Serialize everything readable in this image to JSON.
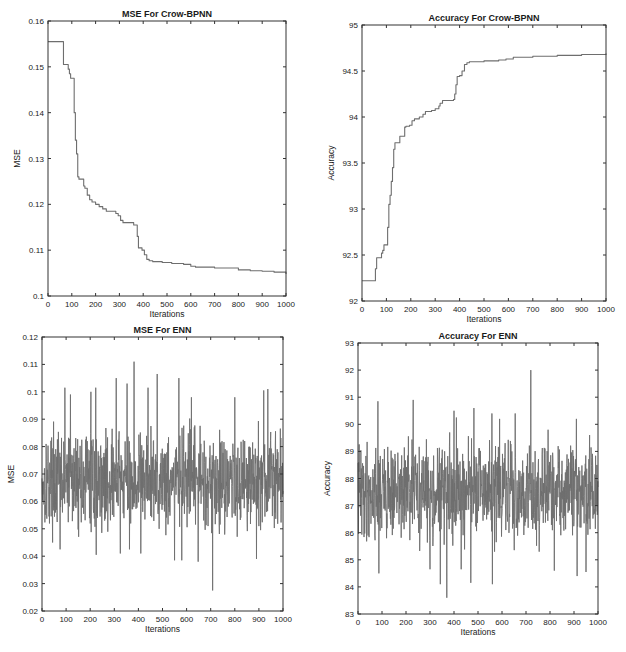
{
  "figure": {
    "background": "#ffffff",
    "line_color": "#6e6e6e",
    "axis_color": "#333333"
  },
  "chart_data": [
    {
      "id": "mse-crow-bpnn",
      "type": "line",
      "title": "MSE For Crow-BPNN",
      "xlabel": "Iterations",
      "ylabel": "MSE",
      "xlim": [
        0,
        1000
      ],
      "ylim": [
        0.1,
        0.16
      ],
      "xticks": [
        0,
        100,
        200,
        300,
        400,
        500,
        600,
        700,
        800,
        900,
        1000
      ],
      "yticks": [
        0.1,
        0.11,
        0.12,
        0.13,
        0.14,
        0.15,
        0.16
      ],
      "ytick_labels": [
        "0.1",
        "0.11",
        "0.12",
        "0.13",
        "0.14",
        "0.15",
        "0.16"
      ],
      "grid": false,
      "step": true,
      "box": {
        "left": 48,
        "top": 21,
        "right": 286,
        "bottom": 296
      },
      "x": [
        0,
        60,
        65,
        80,
        85,
        90,
        95,
        105,
        110,
        115,
        120,
        125,
        130,
        140,
        150,
        155,
        165,
        175,
        185,
        200,
        215,
        230,
        245,
        265,
        285,
        295,
        305,
        315,
        340,
        360,
        370,
        375,
        380,
        385,
        395,
        405,
        415,
        425,
        440,
        480,
        520,
        570,
        600,
        620,
        700,
        800,
        850,
        900,
        950,
        1000
      ],
      "values": [
        0.1555,
        0.1555,
        0.1505,
        0.1505,
        0.1495,
        0.1485,
        0.1475,
        0.1475,
        0.14,
        0.134,
        0.131,
        0.126,
        0.1255,
        0.1255,
        0.124,
        0.1235,
        0.122,
        0.121,
        0.1205,
        0.12,
        0.1195,
        0.119,
        0.1185,
        0.1185,
        0.118,
        0.1175,
        0.1165,
        0.116,
        0.116,
        0.1155,
        0.1155,
        0.113,
        0.1105,
        0.1105,
        0.11,
        0.109,
        0.108,
        0.1077,
        0.1075,
        0.1073,
        0.1071,
        0.1069,
        0.1065,
        0.1063,
        0.1061,
        0.1057,
        0.1055,
        0.1054,
        0.1052,
        0.1048
      ]
    },
    {
      "id": "accuracy-crow-bpnn",
      "type": "line",
      "title": "Accuracy For Crow-BPNN",
      "xlabel": "Iterations",
      "ylabel": "Accuracy",
      "xlim": [
        0,
        1000
      ],
      "ylim": [
        92,
        95
      ],
      "xticks": [
        0,
        100,
        200,
        300,
        400,
        500,
        600,
        700,
        800,
        900,
        1000
      ],
      "yticks": [
        92,
        92.5,
        93,
        93.5,
        94,
        94.5,
        95
      ],
      "ytick_labels": [
        "92",
        "92.5",
        "93",
        "93.5",
        "94",
        "94.5",
        "95"
      ],
      "grid": false,
      "step": true,
      "box": {
        "left": 362,
        "top": 25,
        "right": 606,
        "bottom": 301
      },
      "x": [
        0,
        50,
        55,
        60,
        75,
        80,
        85,
        90,
        100,
        105,
        110,
        115,
        120,
        125,
        130,
        135,
        140,
        155,
        160,
        175,
        180,
        195,
        205,
        215,
        235,
        250,
        260,
        285,
        300,
        315,
        320,
        330,
        340,
        375,
        380,
        385,
        390,
        400,
        410,
        420,
        430,
        440,
        460,
        500,
        560,
        590,
        620,
        700,
        800,
        900,
        1000
      ],
      "values": [
        92.22,
        92.22,
        92.35,
        92.47,
        92.47,
        92.52,
        92.55,
        92.61,
        92.61,
        92.8,
        93.05,
        93.15,
        93.3,
        93.45,
        93.65,
        93.72,
        93.72,
        93.79,
        93.79,
        93.89,
        93.9,
        93.91,
        93.96,
        93.98,
        94.0,
        94.03,
        94.06,
        94.07,
        94.09,
        94.12,
        94.15,
        94.18,
        94.18,
        94.19,
        94.25,
        94.35,
        94.44,
        94.45,
        94.5,
        94.57,
        94.59,
        94.6,
        94.6,
        94.61,
        94.62,
        94.63,
        94.65,
        94.66,
        94.67,
        94.68,
        94.69
      ]
    },
    {
      "id": "mse-enn",
      "type": "line",
      "title": "MSE For ENN",
      "xlabel": "Iterations",
      "ylabel": "MSE",
      "xlim": [
        0,
        1000
      ],
      "ylim": [
        0.02,
        0.12
      ],
      "xticks": [
        0,
        100,
        200,
        300,
        400,
        500,
        600,
        700,
        800,
        900,
        1000
      ],
      "yticks": [
        0.02,
        0.03,
        0.04,
        0.05,
        0.06,
        0.07,
        0.08,
        0.09,
        0.1,
        0.11,
        0.12
      ],
      "ytick_labels": [
        "0.02",
        "0.03",
        "0.04",
        "0.05",
        "0.06",
        "0.07",
        "0.08",
        "0.09",
        "0.1",
        "0.11",
        "0.12"
      ],
      "grid": false,
      "step": false,
      "box": {
        "left": 42,
        "top": 337,
        "right": 283,
        "bottom": 611
      },
      "noise": {
        "n": 1000,
        "mean": 0.068,
        "spread": 0.012,
        "min": 0.045,
        "max": 0.092,
        "seed": 17
      },
      "spikes": [
        {
          "x": 95,
          "y": 0.1015
        },
        {
          "x": 118,
          "y": 0.099
        },
        {
          "x": 203,
          "y": 0.1
        },
        {
          "x": 223,
          "y": 0.1015
        },
        {
          "x": 308,
          "y": 0.105
        },
        {
          "x": 353,
          "y": 0.103
        },
        {
          "x": 382,
          "y": 0.111
        },
        {
          "x": 440,
          "y": 0.1015
        },
        {
          "x": 478,
          "y": 0.1065
        },
        {
          "x": 568,
          "y": 0.105
        },
        {
          "x": 620,
          "y": 0.098
        },
        {
          "x": 800,
          "y": 0.098
        },
        {
          "x": 920,
          "y": 0.1005
        },
        {
          "x": 937,
          "y": 0.101
        },
        {
          "x": 708,
          "y": 0.0275
        },
        {
          "x": 550,
          "y": 0.0385
        },
        {
          "x": 580,
          "y": 0.0385
        },
        {
          "x": 648,
          "y": 0.038
        },
        {
          "x": 890,
          "y": 0.039
        },
        {
          "x": 225,
          "y": 0.0405
        },
        {
          "x": 325,
          "y": 0.041
        },
        {
          "x": 410,
          "y": 0.041
        },
        {
          "x": 75,
          "y": 0.0425
        },
        {
          "x": 363,
          "y": 0.0425
        }
      ]
    },
    {
      "id": "accuracy-enn",
      "type": "line",
      "title": "Accuracy For ENN",
      "xlabel": "Iterations",
      "ylabel": "Accuracy",
      "xlim": [
        0,
        1000
      ],
      "ylim": [
        83,
        93
      ],
      "xticks": [
        0,
        100,
        200,
        300,
        400,
        500,
        600,
        700,
        800,
        900,
        1000
      ],
      "yticks": [
        83,
        84,
        85,
        86,
        87,
        88,
        89,
        90,
        91,
        92,
        93
      ],
      "ytick_labels": [
        "83",
        "84",
        "85",
        "86",
        "87",
        "88",
        "89",
        "90",
        "91",
        "92",
        "93"
      ],
      "grid": false,
      "step": false,
      "box": {
        "left": 358,
        "top": 343,
        "right": 598,
        "bottom": 614
      },
      "noise": {
        "n": 1000,
        "mean": 87.5,
        "spread": 1.2,
        "min": 85.3,
        "max": 89.8,
        "seed": 41
      },
      "spikes": [
        {
          "x": 720,
          "y": 92.0
        },
        {
          "x": 230,
          "y": 90.9
        },
        {
          "x": 83,
          "y": 90.85
        },
        {
          "x": 483,
          "y": 90.6
        },
        {
          "x": 400,
          "y": 90.5
        },
        {
          "x": 558,
          "y": 90.4
        },
        {
          "x": 655,
          "y": 90.4
        },
        {
          "x": 410,
          "y": 90.25
        },
        {
          "x": 910,
          "y": 90.2
        },
        {
          "x": 590,
          "y": 90.2
        },
        {
          "x": 370,
          "y": 83.6
        },
        {
          "x": 343,
          "y": 84.1
        },
        {
          "x": 470,
          "y": 84.15
        },
        {
          "x": 560,
          "y": 84.1
        },
        {
          "x": 913,
          "y": 84.4
        },
        {
          "x": 87,
          "y": 84.5
        },
        {
          "x": 950,
          "y": 84.55
        },
        {
          "x": 818,
          "y": 84.6
        },
        {
          "x": 300,
          "y": 84.65
        },
        {
          "x": 430,
          "y": 84.65
        }
      ]
    }
  ]
}
